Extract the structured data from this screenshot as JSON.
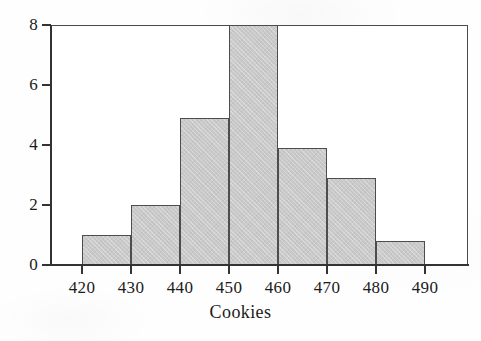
{
  "chart_data": {
    "type": "bar",
    "title": "",
    "subtitle": "",
    "xlabel": "Cookies",
    "ylabel": "",
    "grid": false,
    "legend": false,
    "legend_position": "none",
    "bar_style": "histogram",
    "xlim": [
      415,
      500
    ],
    "ylim": [
      0,
      8
    ],
    "x_ticks": [
      420,
      430,
      440,
      450,
      460,
      470,
      480,
      490
    ],
    "x_tick_labels": [
      "420",
      "430",
      "440",
      "450",
      "460",
      "470",
      "480",
      "490"
    ],
    "y_ticks": [
      0,
      2,
      4,
      6,
      8
    ],
    "y_tick_labels": [
      "0",
      "2",
      "4",
      "6",
      "8"
    ],
    "bin_edges": [
      420,
      430,
      440,
      450,
      460,
      470,
      480,
      490
    ],
    "bin_labels": [
      "420-430",
      "430-440",
      "440-450",
      "450-460",
      "460-470",
      "470-480",
      "480-490"
    ],
    "categories": [
      "420-430",
      "430-440",
      "440-450",
      "450-460",
      "460-470",
      "470-480",
      "480-490"
    ],
    "values": [
      1.0,
      2.0,
      4.9,
      8.0,
      3.9,
      2.9,
      0.8
    ],
    "bar_fill_color": "#c9c9c9",
    "bar_edge_color": "#4d4d4d",
    "axis_color": "#333333",
    "frame_color": "#4a4a4a",
    "background_color": "#ffffff"
  },
  "axes": {
    "x_title": "Cookies",
    "y_title": ""
  }
}
